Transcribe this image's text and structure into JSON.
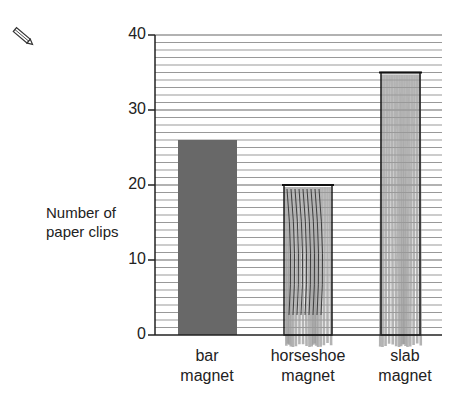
{
  "toolbar": {
    "icon": "pencil-icon"
  },
  "chart_data": {
    "type": "bar",
    "title": "",
    "xlabel": "",
    "ylabel": "Number of paper clips",
    "ylabel_lines": [
      "Number of",
      "paper clips"
    ],
    "categories": [
      "bar magnet",
      "horseshoe magnet",
      "slab magnet"
    ],
    "category_lines": [
      [
        "bar",
        "magnet"
      ],
      [
        "horseshoe",
        "magnet"
      ],
      [
        "slab",
        "magnet"
      ]
    ],
    "values": [
      26,
      20,
      35
    ],
    "ylim": [
      0,
      40
    ],
    "yticks": [
      0,
      10,
      20,
      30,
      40
    ],
    "grid": true,
    "grid_step": 1,
    "bar_styles": [
      "solid",
      "hand-drawn",
      "hand-drawn"
    ],
    "colors": {
      "solid_bar": "#686868",
      "sketch": "#9a9a9a",
      "grid": "#999999",
      "axis": "#222222"
    }
  }
}
